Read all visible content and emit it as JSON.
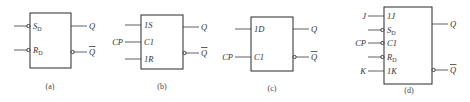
{
  "figures": [
    {
      "id": "a",
      "caption": "(a)",
      "inputs": [
        {
          "name": "S",
          "sub": "D",
          "bubble": true,
          "ext": ""
        },
        {
          "name": "R",
          "sub": "D",
          "bubble": true,
          "ext": ""
        }
      ],
      "outputs": [
        {
          "name": "Q",
          "bubble": false
        },
        {
          "name": "Q",
          "bar": true,
          "bubble": true
        }
      ]
    },
    {
      "id": "b",
      "caption": "(b)",
      "inputs": [
        {
          "prefix": "1",
          "name": "S",
          "bubble": false,
          "ext": ""
        },
        {
          "prefix": "",
          "name": "C1",
          "bubble": false,
          "ext": "CP"
        },
        {
          "prefix": "1",
          "name": "R",
          "bubble": false,
          "ext": ""
        }
      ],
      "outputs": [
        {
          "name": "Q",
          "bubble": false
        },
        {
          "name": "Q",
          "bar": true,
          "bubble": true
        }
      ]
    },
    {
      "id": "c",
      "caption": "(c)",
      "inputs": [
        {
          "prefix": "1",
          "name": "D",
          "bubble": false,
          "ext": ""
        },
        {
          "prefix": "",
          "name": "C1",
          "bubble": false,
          "ext": "CP"
        }
      ],
      "outputs": [
        {
          "name": "Q",
          "bubble": false
        },
        {
          "name": "Q",
          "bar": true,
          "bubble": true
        }
      ]
    },
    {
      "id": "d",
      "caption": "(d)",
      "inputs": [
        {
          "prefix": "1",
          "name": "J",
          "bubble": false,
          "ext": "J"
        },
        {
          "name": "S",
          "sub": "D",
          "bubble": true,
          "ext": ""
        },
        {
          "prefix": "",
          "name": "C1",
          "bubble": true,
          "ext": "CP"
        },
        {
          "name": "R",
          "sub": "D",
          "bubble": true,
          "ext": ""
        },
        {
          "prefix": "1",
          "name": "K",
          "bubble": false,
          "ext": "K"
        }
      ],
      "outputs": [
        {
          "name": "Q",
          "bubble": false
        },
        {
          "name": "Q",
          "bar": true,
          "bubble": true
        }
      ]
    }
  ]
}
